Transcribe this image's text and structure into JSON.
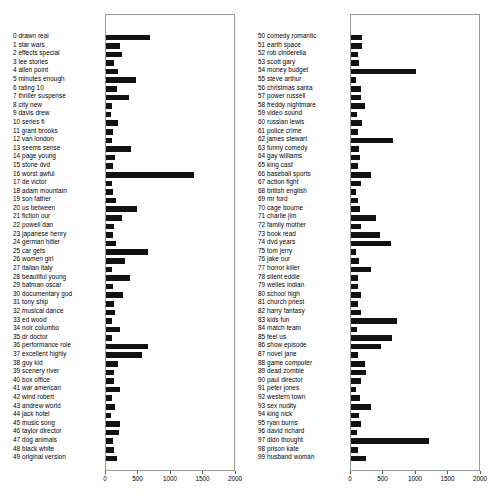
{
  "chart_data": {
    "type": "bar",
    "orientation": "horizontal",
    "title": "",
    "xlabel": "",
    "ylabel": "",
    "xlim": [
      0,
      2000
    ],
    "xticks": [
      0,
      500,
      1000,
      1500,
      2000
    ],
    "xticklabels": [
      "0",
      "500",
      "1000",
      "1500",
      "2000"
    ],
    "grid": false,
    "legend": null,
    "panels": [
      {
        "name": "topics-0-49",
        "categories": [
          "0 drawn real",
          "1 star wars",
          "2 effects special",
          "3 lee stories",
          "4 allen point",
          "5 minutes enough",
          "6 rating 10",
          "7 thriller suspense",
          "8 city new",
          "9 davis drew",
          "10 series fi",
          "11 grant brooks",
          "12 van london",
          "13 seems sense",
          "14 page young",
          "15 stone dvd",
          "16 worst awful",
          "17 de victor",
          "18 adam mountain",
          "19 son father",
          "20 us between",
          "21 fiction our",
          "22 powell dan",
          "23 japanese henry",
          "24 german hitler",
          "25 car gets",
          "26 women girl",
          "27 italian italy",
          "28 beautiful young",
          "29 batman oscar",
          "30 documentary god",
          "31 tony ship",
          "32 musical dance",
          "33 ed wood",
          "34 noir columbo",
          "35 dr doctor",
          "36 performance role",
          "37 excellent highly",
          "38 guy kid",
          "39 scenery river",
          "40 box office",
          "41 war american",
          "42 wind robert",
          "43 andrew world",
          "44 jack hotel",
          "45 music song",
          "46 taylor director",
          "47 dog animals",
          "48 black white",
          "49 original version"
        ],
        "values": [
          680,
          220,
          255,
          120,
          190,
          465,
          165,
          360,
          95,
          85,
          180,
          110,
          95,
          385,
          140,
          110,
          1370,
          90,
          115,
          160,
          485,
          255,
          130,
          105,
          160,
          660,
          290,
          100,
          370,
          105,
          260,
          120,
          140,
          95,
          215,
          90,
          660,
          570,
          190,
          120,
          120,
          225,
          95,
          140,
          85,
          215,
          205,
          110,
          130,
          165
        ]
      },
      {
        "name": "topics-50-99",
        "categories": [
          "50 comedy romantic",
          "51 earth space",
          "52 rob cinderella",
          "53 scott gary",
          "54 money budget",
          "55 steve arthur",
          "56 christmas santa",
          "57 power russell",
          "58 freddy nightmare",
          "59 video sound",
          "60 russian lewis",
          "61 police crime",
          "62 james stewart",
          "63 funny comedy",
          "64 gay williams",
          "65 king cast",
          "66 baseball sports",
          "67 action fight",
          "68 british english",
          "69 mr ford",
          "70 cage bourne",
          "71 charlie jim",
          "72 family mother",
          "73 book read",
          "74 dvd years",
          "75 tom jerry",
          "76 jake our",
          "77 horror killer",
          "78 silent eddie",
          "79 welles indian",
          "80 school high",
          "81 church priest",
          "82 harry fantasy",
          "83 kids fun",
          "84 match team",
          "85 feel us",
          "86 show episode",
          "87 novel jane",
          "88 game computer",
          "89 dead zombie",
          "90 paul director",
          "91 peter jones",
          "92 western town",
          "93 sex nudity",
          "94 king nick",
          "95 ryan burns",
          "96 david richard",
          "97 didn thought",
          "98 prison kate",
          "99 husband woman"
        ],
        "values": [
          175,
          170,
          105,
          125,
          1020,
          80,
          150,
          150,
          215,
          95,
          175,
          105,
          660,
          130,
          135,
          105,
          310,
          160,
          80,
          105,
          145,
          395,
          160,
          450,
          630,
          85,
          125,
          320,
          105,
          110,
          150,
          110,
          150,
          715,
          90,
          640,
          465,
          110,
          225,
          230,
          160,
          80,
          135,
          310,
          120,
          155,
          90,
          1225,
          115,
          240
        ]
      }
    ]
  }
}
